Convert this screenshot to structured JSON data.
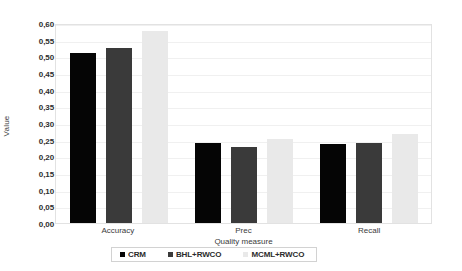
{
  "chart_data": {
    "type": "bar",
    "title": "",
    "xlabel": "Quality measure",
    "ylabel": "Value",
    "categories": [
      "Accuracy",
      "Prec",
      "Recall"
    ],
    "ylim": [
      0.0,
      0.6
    ],
    "ytick_step": 0.05,
    "ytick_labels": [
      "0,00",
      "0,05",
      "0,10",
      "0,15",
      "0,20",
      "0,25",
      "0,30",
      "0,35",
      "0,40",
      "0,45",
      "0,50",
      "0,55",
      "0,60"
    ],
    "ytick_values": [
      0.0,
      0.05,
      0.1,
      0.15,
      0.2,
      0.25,
      0.3,
      0.35,
      0.4,
      0.45,
      0.5,
      0.55,
      0.6
    ],
    "grid": true,
    "legend_position": "bottom",
    "series": [
      {
        "name": "CRM",
        "color": "#050505",
        "values": [
          0.51,
          0.24,
          0.238
        ]
      },
      {
        "name": "BHL+RWCO",
        "color": "#3a3a3a",
        "values": [
          0.525,
          0.227,
          0.241
        ]
      },
      {
        "name": "MCML+RWCO",
        "color": "#e9e9e9",
        "values": [
          0.575,
          0.252,
          0.266
        ]
      }
    ]
  },
  "axes": {
    "y_title": "Value",
    "x_title": "Quality measure"
  },
  "colors": {
    "series_1": "#050505",
    "series_2": "#3a3a3a",
    "series_3": "#e9e9e9",
    "plot_border": "#e2e2e2",
    "gridline": "#f0f0f0",
    "text": "#3b3b3b"
  }
}
